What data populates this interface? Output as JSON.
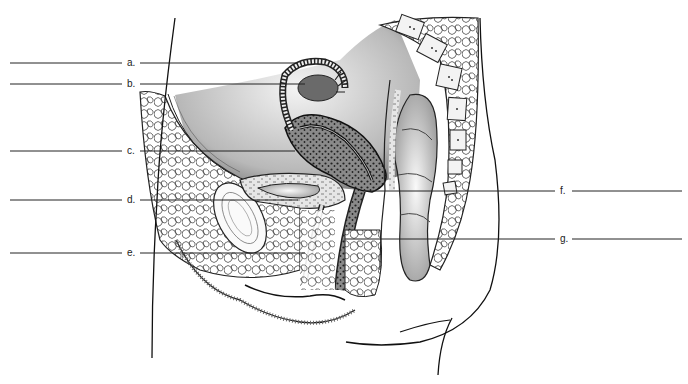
{
  "diagram": {
    "type": "anatomical-sagittal-section",
    "labels_left": [
      {
        "letter": "a.",
        "y": 63
      },
      {
        "letter": "b.",
        "y": 84
      },
      {
        "letter": "c.",
        "y": 150
      },
      {
        "letter": "d.",
        "y": 199
      },
      {
        "letter": "e.",
        "y": 252
      }
    ],
    "labels_right": [
      {
        "letter": "f.",
        "y": 191
      },
      {
        "letter": "g.",
        "y": 239
      }
    ],
    "colors": {
      "line": "#222222",
      "stipple_dark": "#3a3a3a",
      "stipple_light": "#bdbdbd",
      "background": "#ffffff"
    }
  }
}
